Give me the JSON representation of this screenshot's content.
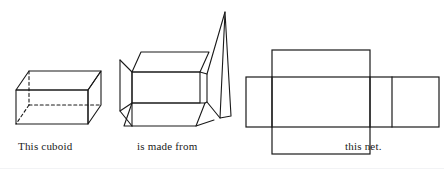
{
  "page": {
    "title": "This cuboid is made from this net.",
    "background_color": "#ffffff",
    "stroke_color": "#1a1a1a",
    "width": 444,
    "height": 176
  },
  "captions": {
    "cuboid": "This cuboid",
    "made_from": "is made from",
    "net": "this net."
  },
  "figures": {
    "cuboid": {
      "name": "cuboid-solid",
      "description": "Solid rectangular cuboid drawn in oblique projection with hidden edges dashed",
      "hidden_edge_style": "dashed",
      "visible_edge_style": "solid"
    },
    "opened_box": {
      "name": "opened-box",
      "description": "Cuboid box with its flaps opened outward, one tall flap raised at the right"
    },
    "net": {
      "name": "cuboid-net",
      "description": "Flat net of the cuboid: a horizontal strip of four rectangles crossed by a vertical rectangle forming the top and bottom faces",
      "face_count": 6
    }
  }
}
